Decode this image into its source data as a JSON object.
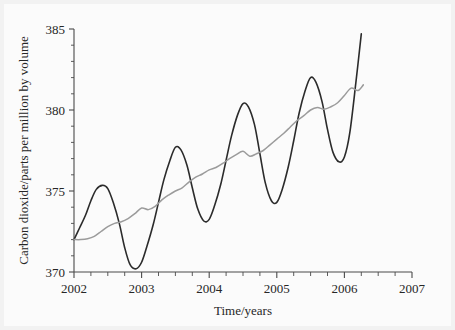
{
  "chart_data": {
    "type": "line",
    "title": "",
    "xlabel": "Time/years",
    "ylabel": "Carbon dioxide/parts per million by volume",
    "xlim": [
      2002,
      2007
    ],
    "ylim": [
      370,
      385
    ],
    "xticks": [
      2002,
      2003,
      2004,
      2005,
      2006,
      2007
    ],
    "xtick_labels": [
      "2002",
      "2003",
      "2004",
      "2005",
      "2006",
      "2007"
    ],
    "yticks": [
      370,
      375,
      380,
      385
    ],
    "ytick_labels": [
      "370",
      "375",
      "380",
      "385"
    ],
    "x_minor_per_interval": 3,
    "y_minor_per_interval": 4,
    "grid": false,
    "legend": "none",
    "colors": {
      "raw": "#2b2b2b",
      "trend": "#9b9b9b",
      "axis": "#4a4a4a",
      "background": "#f2f2f2",
      "paper": "#fbfbfb"
    },
    "series": [
      {
        "name": "monthly-mean-co2",
        "style": "solid-dark",
        "x": [
          2002.0,
          2002.08,
          2002.17,
          2002.25,
          2002.33,
          2002.42,
          2002.5,
          2002.58,
          2002.67,
          2002.75,
          2002.83,
          2002.92,
          2003.0,
          2003.08,
          2003.17,
          2003.25,
          2003.33,
          2003.42,
          2003.5,
          2003.58,
          2003.67,
          2003.75,
          2003.83,
          2003.92,
          2004.0,
          2004.08,
          2004.17,
          2004.25,
          2004.33,
          2004.42,
          2004.5,
          2004.58,
          2004.67,
          2004.75,
          2004.83,
          2004.92,
          2005.0,
          2005.08,
          2005.17,
          2005.25,
          2005.33,
          2005.42,
          2005.5,
          2005.58,
          2005.67,
          2005.75,
          2005.83,
          2005.92,
          2006.0,
          2006.08,
          2006.17,
          2006.25
        ],
        "y": [
          372.0,
          372.7,
          373.5,
          374.4,
          375.1,
          375.35,
          375.15,
          374.3,
          373.0,
          371.5,
          370.45,
          370.2,
          370.6,
          371.6,
          372.9,
          374.3,
          375.7,
          376.9,
          377.7,
          377.55,
          376.6,
          375.2,
          373.9,
          373.15,
          373.25,
          374.1,
          375.4,
          376.9,
          378.4,
          379.7,
          380.4,
          380.2,
          379.1,
          377.3,
          375.5,
          374.4,
          374.3,
          375.1,
          376.5,
          378.1,
          379.8,
          381.2,
          382.0,
          381.7,
          380.5,
          378.8,
          377.4,
          376.8,
          377.1,
          378.6,
          381.7,
          384.7
        ]
      },
      {
        "name": "smoothed-trend-co2",
        "style": "solid-gray",
        "x": [
          2002.0,
          2002.1,
          2002.2,
          2002.3,
          2002.4,
          2002.5,
          2002.6,
          2002.7,
          2002.8,
          2002.9,
          2003.0,
          2003.1,
          2003.2,
          2003.3,
          2003.4,
          2003.5,
          2003.6,
          2003.7,
          2003.8,
          2003.9,
          2004.0,
          2004.1,
          2004.2,
          2004.3,
          2004.4,
          2004.5,
          2004.6,
          2004.7,
          2004.8,
          2004.9,
          2005.0,
          2005.1,
          2005.2,
          2005.3,
          2005.4,
          2005.5,
          2005.6,
          2005.7,
          2005.8,
          2005.9,
          2006.0,
          2006.1,
          2006.2,
          2006.28
        ],
        "y": [
          372.0,
          372.0,
          372.05,
          372.2,
          372.5,
          372.8,
          373.0,
          373.1,
          373.3,
          373.6,
          373.95,
          373.85,
          374.05,
          374.45,
          374.75,
          375.0,
          375.2,
          375.55,
          375.85,
          376.05,
          376.3,
          376.45,
          376.7,
          377.0,
          377.25,
          377.45,
          377.15,
          377.3,
          377.5,
          377.85,
          378.2,
          378.55,
          378.95,
          379.35,
          379.65,
          380.0,
          380.15,
          380.05,
          380.2,
          380.45,
          380.9,
          381.35,
          381.2,
          381.55
        ]
      }
    ]
  }
}
